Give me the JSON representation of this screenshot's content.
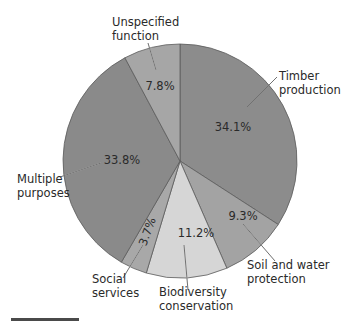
{
  "chart_data": {
    "type": "pie",
    "title": "",
    "start_angle_deg": 0,
    "direction": "clockwise",
    "slices": [
      {
        "label": "Timber production",
        "label_lines": [
          "Timber",
          "production"
        ],
        "value": 34.1,
        "value_label": "34.1%",
        "color": "#8c8c8c"
      },
      {
        "label": "Soil and water protection",
        "label_lines": [
          "Soil and water",
          "protection"
        ],
        "value": 9.3,
        "value_label": "9.3%",
        "color": "#a3a3a3"
      },
      {
        "label": "Biodiversity conservation",
        "label_lines": [
          "Biodiversity",
          "conservation"
        ],
        "value": 11.2,
        "value_label": "11.2%",
        "color": "#d6d6d6"
      },
      {
        "label": "Social services",
        "label_lines": [
          "Social",
          "services"
        ],
        "value": 3.7,
        "value_label": "3.7%",
        "color": "#a8a8a8"
      },
      {
        "label": "Multiple purposes",
        "label_lines": [
          "Multiple",
          "purposes"
        ],
        "value": 33.8,
        "value_label": "33.8%",
        "color": "#8a8a8a"
      },
      {
        "label": "Unspecified function",
        "label_lines": [
          "Unspecified",
          "function"
        ],
        "value": 7.8,
        "value_label": "7.8%",
        "color": "#a6a6a6"
      }
    ],
    "legend": "none",
    "grid": false
  },
  "layout": {
    "cx": 180,
    "cy": 161,
    "r": 117,
    "pct_positions": [
      {
        "x": 233,
        "y": 131,
        "rotate": 0
      },
      {
        "x": 243,
        "y": 220,
        "rotate": 0
      },
      {
        "x": 196,
        "y": 237,
        "rotate": 0
      },
      {
        "x": 151,
        "y": 233,
        "rotate": -70
      },
      {
        "x": 122,
        "y": 164,
        "rotate": 0
      },
      {
        "x": 160,
        "y": 90,
        "rotate": 0
      }
    ],
    "label_positions": [
      {
        "x": 279,
        "y": 80,
        "anchor": "start"
      },
      {
        "x": 247,
        "y": 269,
        "anchor": "start"
      },
      {
        "x": 159,
        "y": 296,
        "anchor": "start"
      },
      {
        "x": 92,
        "y": 283,
        "anchor": "start"
      },
      {
        "x": 17,
        "y": 183,
        "anchor": "start"
      },
      {
        "x": 112,
        "y": 26,
        "anchor": "start"
      }
    ],
    "leader_lines": [
      {
        "x1": 277,
        "y1": 77,
        "x2": 247,
        "y2": 107
      },
      {
        "x1": 275,
        "y1": 261,
        "x2": 243,
        "y2": 224
      },
      {
        "x1": 188,
        "y1": 290,
        "x2": 184,
        "y2": 245
      },
      {
        "x1": 123,
        "y1": 278,
        "x2": 143,
        "y2": 245
      },
      {
        "x1": 60,
        "y1": 177,
        "x2": 101,
        "y2": 163
      },
      {
        "x1": 148,
        "y1": 43,
        "x2": 156,
        "y2": 70
      }
    ]
  }
}
